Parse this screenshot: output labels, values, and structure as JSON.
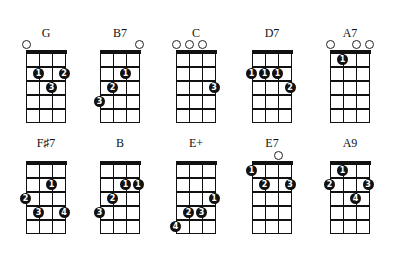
{
  "diagram": {
    "type": "ukulele-chord-chart",
    "strings": 4,
    "frets": 5,
    "colors": {
      "ink": "#111111",
      "background": "#ffffff",
      "finger_text": "#ffffff"
    },
    "chords": [
      {
        "name": "G",
        "open": [
          1
        ],
        "fingers": [
          {
            "string": 2,
            "fret": 2,
            "finger": "1"
          },
          {
            "string": 4,
            "fret": 2,
            "finger": "2"
          },
          {
            "string": 3,
            "fret": 3,
            "finger": "3"
          }
        ]
      },
      {
        "name": "B7",
        "open": [
          4
        ],
        "fingers": [
          {
            "string": 3,
            "fret": 2,
            "finger": "1"
          },
          {
            "string": 2,
            "fret": 3,
            "finger": "2"
          },
          {
            "string": 1,
            "fret": 4,
            "finger": "3"
          }
        ]
      },
      {
        "name": "C",
        "open": [
          1,
          2,
          3
        ],
        "fingers": [
          {
            "string": 4,
            "fret": 3,
            "finger": "3"
          }
        ]
      },
      {
        "name": "D7",
        "open": [],
        "fingers": [
          {
            "string": 1,
            "fret": 2,
            "finger": "1"
          },
          {
            "string": 2,
            "fret": 2,
            "finger": "1"
          },
          {
            "string": 3,
            "fret": 2,
            "finger": "1"
          },
          {
            "string": 4,
            "fret": 3,
            "finger": "2"
          }
        ]
      },
      {
        "name": "A7",
        "open": [
          1,
          3,
          4
        ],
        "fingers": [
          {
            "string": 2,
            "fret": 1,
            "finger": "1"
          }
        ]
      },
      {
        "name": "F♯7",
        "open": [],
        "fingers": [
          {
            "string": 3,
            "fret": 2,
            "finger": "1"
          },
          {
            "string": 1,
            "fret": 3,
            "finger": "2"
          },
          {
            "string": 2,
            "fret": 4,
            "finger": "3"
          },
          {
            "string": 4,
            "fret": 4,
            "finger": "4"
          }
        ]
      },
      {
        "name": "B",
        "open": [],
        "fingers": [
          {
            "string": 3,
            "fret": 2,
            "finger": "1"
          },
          {
            "string": 4,
            "fret": 2,
            "finger": "1"
          },
          {
            "string": 2,
            "fret": 3,
            "finger": "2"
          },
          {
            "string": 1,
            "fret": 4,
            "finger": "3"
          }
        ]
      },
      {
        "name": "E+",
        "open": [],
        "fingers": [
          {
            "string": 4,
            "fret": 3,
            "finger": "1"
          },
          {
            "string": 2,
            "fret": 4,
            "finger": "2"
          },
          {
            "string": 3,
            "fret": 4,
            "finger": "3"
          },
          {
            "string": 1,
            "fret": 5,
            "finger": "4"
          }
        ]
      },
      {
        "name": "E7",
        "open": [
          3
        ],
        "fingers": [
          {
            "string": 1,
            "fret": 1,
            "finger": "1"
          },
          {
            "string": 2,
            "fret": 2,
            "finger": "2"
          },
          {
            "string": 4,
            "fret": 2,
            "finger": "3"
          }
        ]
      },
      {
        "name": "A9",
        "open": [],
        "fingers": [
          {
            "string": 2,
            "fret": 1,
            "finger": "1"
          },
          {
            "string": 1,
            "fret": 2,
            "finger": "2"
          },
          {
            "string": 4,
            "fret": 2,
            "finger": "3"
          },
          {
            "string": 3,
            "fret": 3,
            "finger": "4"
          }
        ]
      }
    ]
  }
}
